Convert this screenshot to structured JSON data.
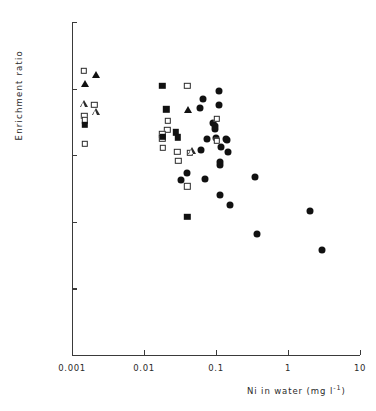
{
  "chart_data": {
    "type": "scatter",
    "title": "",
    "xlabel": "Ni in water (mg l-1)",
    "xlabel_base": "Ni in water (mg l",
    "xlabel_exp": "-1",
    "xlabel_tail": ")",
    "ylabel": "Enrichment ratio",
    "xscale": "log",
    "yscale": "log",
    "xlim": [
      0.001,
      10
    ],
    "ylim": [
      1,
      100000
    ],
    "xticks": [
      0.001,
      0.01,
      0.1,
      1,
      10
    ],
    "xticklabels": [
      "0.001",
      "0.01",
      "0.1",
      "1",
      "10"
    ],
    "yticks": [
      1,
      10,
      100,
      1000,
      10000,
      100000
    ],
    "yticklabels": [
      "1",
      "10",
      "100",
      "1000",
      "10000",
      "100000"
    ],
    "grid": false,
    "legend": "none",
    "marker_colors": {
      "filled": "#111111",
      "open_edge": "#2a2a2a",
      "open_face": "#ffffff"
    },
    "series": [
      {
        "name": "filled-circle",
        "marker": "circle-filled",
        "points": [
          [
            0.0655,
            7100
          ],
          [
            0.0605,
            5200
          ],
          [
            0.109,
            9100
          ],
          [
            0.11,
            5700
          ],
          [
            0.092,
            3050
          ],
          [
            0.096,
            2750
          ],
          [
            0.098,
            2450
          ],
          [
            0.137,
            1780
          ],
          [
            0.142,
            1700
          ],
          [
            0.076,
            1760
          ],
          [
            0.101,
            1800
          ],
          [
            0.116,
            1320
          ],
          [
            0.149,
            1120
          ],
          [
            0.061,
            1180
          ],
          [
            0.112,
            800
          ],
          [
            0.113,
            720
          ],
          [
            0.0395,
            540
          ],
          [
            0.07,
            440
          ],
          [
            0.033,
            420
          ],
          [
            0.35,
            470
          ],
          [
            0.112,
            250
          ],
          [
            0.155,
            180
          ],
          [
            0.37,
            66
          ],
          [
            2.05,
            145
          ],
          [
            3.0,
            38
          ]
        ]
      },
      {
        "name": "open-square",
        "marker": "square-open",
        "points": [
          [
            0.00145,
            18500
          ],
          [
            0.00148,
            3900
          ],
          [
            0.0015,
            3350
          ],
          [
            0.00152,
            1480
          ],
          [
            0.04,
            11000
          ],
          [
            0.0215,
            3300
          ],
          [
            0.021,
            2400
          ],
          [
            0.018,
            2050
          ],
          [
            0.018,
            1800
          ],
          [
            0.0182,
            1280
          ],
          [
            0.029,
            1120
          ],
          [
            0.03,
            830
          ],
          [
            0.04,
            340
          ],
          [
            0.043,
            1080
          ],
          [
            0.102,
            3500
          ],
          [
            0.102,
            1650
          ],
          [
            0.00205,
            5700
          ]
        ]
      },
      {
        "name": "filled-square",
        "marker": "square-filled",
        "points": [
          [
            0.0015,
            2850
          ],
          [
            0.018,
            11100
          ],
          [
            0.0205,
            4900
          ],
          [
            0.0278,
            2200
          ],
          [
            0.0182,
            1870
          ],
          [
            0.0295,
            1850
          ],
          [
            0.04,
            120
          ]
        ]
      },
      {
        "name": "open-triangle",
        "marker": "triangle-open",
        "points": [
          [
            0.00148,
            5900
          ],
          [
            0.00215,
            5700
          ],
          [
            0.046,
            1850
          ]
        ]
      },
      {
        "name": "filled-triangle",
        "marker": "triangle-filled",
        "points": [
          [
            0.00152,
            11700
          ],
          [
            0.00218,
            16200
          ],
          [
            0.041,
            4700
          ]
        ]
      }
    ]
  }
}
